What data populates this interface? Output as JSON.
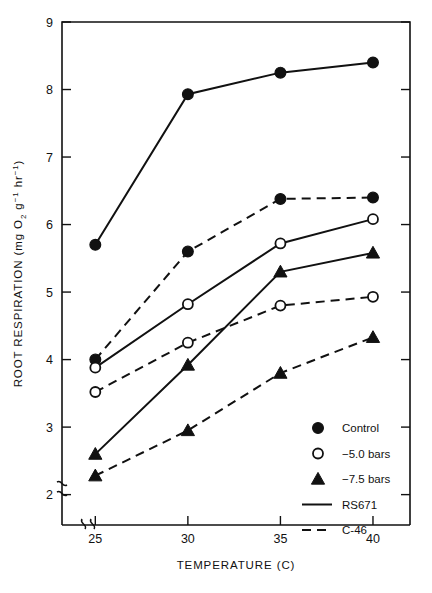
{
  "chart_data": {
    "type": "line",
    "title": "",
    "xlabel": "TEMPERATURE (C)",
    "ylabel": "ROOT RESPIRATION (mg O2 g-1 hr-1)",
    "ylabel_parts": {
      "main": "ROOT RESPIRATION  (mg O",
      "sub_o2": "2",
      "mid": " g",
      "sup1": "−1",
      "mid2": " hr",
      "sup2": "−1",
      "close": ")"
    },
    "x": [
      25,
      30,
      35,
      40
    ],
    "xticklabels": [
      "25",
      "30",
      "35",
      "40"
    ],
    "yticklabels": [
      "2",
      "3",
      "4",
      "5",
      "6",
      "7",
      "8",
      "9"
    ],
    "yticks": [
      2,
      3,
      4,
      5,
      6,
      7,
      8,
      9
    ],
    "xlim": [
      23.2,
      42.0
    ],
    "ylim": [
      1.55,
      9.0
    ],
    "grid": false,
    "axis_break_x": true,
    "axis_break_y": true,
    "legend_position": "lower-right",
    "series": [
      {
        "name": "Control RS671",
        "cultivar": "RS671",
        "treatment": "Control",
        "marker": "filled-circle",
        "line": "solid",
        "values": [
          5.7,
          7.93,
          8.25,
          8.4
        ]
      },
      {
        "name": "Control C-46",
        "cultivar": "C-46",
        "treatment": "Control",
        "marker": "filled-circle",
        "line": "dashed",
        "values": [
          4.0,
          5.6,
          6.38,
          6.4
        ]
      },
      {
        "name": "-5.0 bars RS671",
        "cultivar": "RS671",
        "treatment": "-5.0 bars",
        "marker": "open-circle",
        "line": "solid",
        "values": [
          3.88,
          4.82,
          5.72,
          6.08
        ]
      },
      {
        "name": "-5.0 bars C-46",
        "cultivar": "C-46",
        "treatment": "-5.0 bars",
        "marker": "open-circle",
        "line": "dashed",
        "values": [
          3.52,
          4.25,
          4.8,
          4.93
        ]
      },
      {
        "name": "-7.5 bars RS671",
        "cultivar": "RS671",
        "treatment": "-7.5 bars",
        "marker": "filled-triangle",
        "line": "solid",
        "values": [
          2.6,
          3.92,
          5.3,
          5.58
        ]
      },
      {
        "name": "-7.5 bars C-46",
        "cultivar": "C-46",
        "treatment": "-7.5 bars",
        "marker": "filled-triangle",
        "line": "dashed",
        "values": [
          2.28,
          2.95,
          3.8,
          4.33
        ]
      }
    ],
    "legend": [
      {
        "label": "Control",
        "symbol": "filled-circle"
      },
      {
        "label": "−5.0 bars",
        "symbol": "open-circle"
      },
      {
        "label": "−7.5 bars",
        "symbol": "filled-triangle"
      },
      {
        "label": "RS671",
        "symbol": "solid-line"
      },
      {
        "label": "C-46",
        "symbol": "dashed-line"
      }
    ],
    "colors": {
      "ink": "#111111",
      "background": "#ffffff"
    }
  },
  "page": {
    "top_artifact": "",
    "bottom_artifact": ""
  }
}
